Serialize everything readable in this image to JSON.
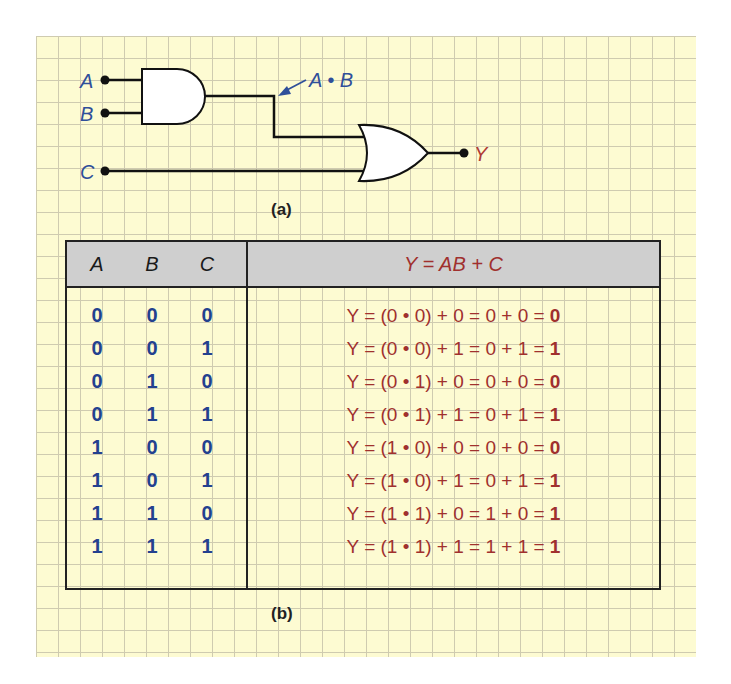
{
  "diagram": {
    "inputs": [
      {
        "label": "A",
        "x": 105,
        "y": 80
      },
      {
        "label": "B",
        "x": 105,
        "y": 113
      },
      {
        "label": "C",
        "x": 105,
        "y": 171
      }
    ],
    "gates": [
      {
        "type": "AND",
        "inputs": [
          "A",
          "B"
        ],
        "output": "A • B"
      },
      {
        "type": "OR",
        "inputs": [
          "A • B",
          "C"
        ],
        "output": "Y"
      }
    ],
    "intermediate_label": "A • B",
    "output_label": "Y",
    "caption_a": "(a)",
    "caption_b": "(b)",
    "colors": {
      "input_label": "#2f4f9a",
      "output_label": "#b03a34",
      "bits": "#23418f",
      "expression": "#a0302e",
      "paper": "#fdfbd2",
      "grid": "#cfcbb0",
      "header_bg": "#cfcfcf"
    }
  },
  "table": {
    "headers": {
      "a": "A",
      "b": "B",
      "c": "C",
      "expr": "Y = AB + C"
    },
    "rows": [
      {
        "a": "0",
        "b": "0",
        "c": "0",
        "expr": "Y = (0 • 0) + 0 = 0 + 0 = ",
        "y": "0"
      },
      {
        "a": "0",
        "b": "0",
        "c": "1",
        "expr": "Y = (0 • 0) + 1 = 0 + 1 = ",
        "y": "1"
      },
      {
        "a": "0",
        "b": "1",
        "c": "0",
        "expr": "Y = (0 • 1) + 0 = 0 + 0 = ",
        "y": "0"
      },
      {
        "a": "0",
        "b": "1",
        "c": "1",
        "expr": "Y = (0 • 1) + 1 = 0 + 1 = ",
        "y": "1"
      },
      {
        "a": "1",
        "b": "0",
        "c": "0",
        "expr": "Y = (1 • 0) + 0 = 0 + 0 = ",
        "y": "0"
      },
      {
        "a": "1",
        "b": "0",
        "c": "1",
        "expr": "Y = (1 • 0) + 1 = 0 + 1 = ",
        "y": "1"
      },
      {
        "a": "1",
        "b": "1",
        "c": "0",
        "expr": "Y = (1 • 1) + 0 = 1 + 0 = ",
        "y": "1"
      },
      {
        "a": "1",
        "b": "1",
        "c": "1",
        "expr": "Y = (1 • 1) + 1 = 1 + 1 = ",
        "y": "1"
      }
    ]
  }
}
